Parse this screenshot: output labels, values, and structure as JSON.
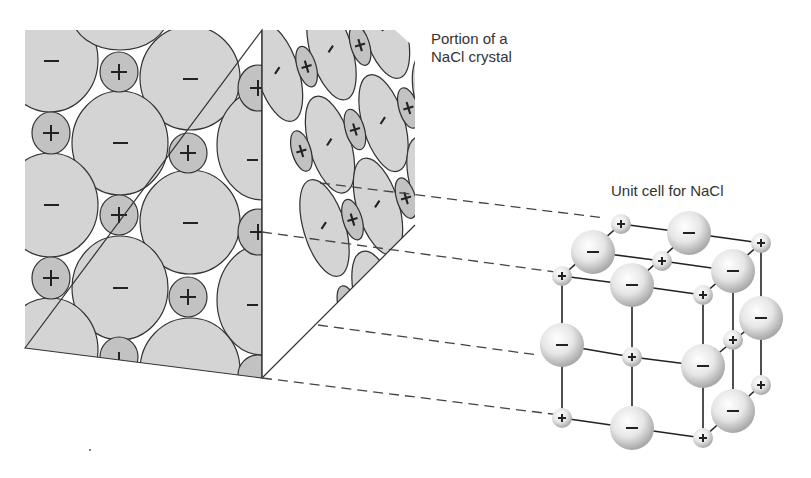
{
  "labels": {
    "crystal_portion": "Portion of a NaCl crystal",
    "unit_cell": "Unit cell for NaCl"
  },
  "ions": {
    "cation_symbol": "+",
    "anion_symbol": "−",
    "cation": "Na+",
    "anion": "Cl-"
  },
  "colors": {
    "anion_fill": "#d4d4d4",
    "cation_fill": "#c2c2c2",
    "outline": "#333333",
    "sphere_light": "#ffffff",
    "sphere_dark": "#9a9a9a"
  }
}
